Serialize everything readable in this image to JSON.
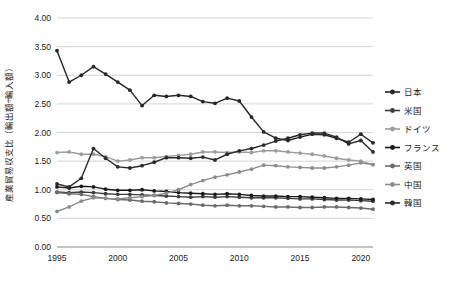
{
  "chart_data": {
    "type": "line",
    "title": "",
    "xlabel": "",
    "ylabel": "産業貿易収支比（輸出額÷輸入額）",
    "xlim": [
      1995,
      2021
    ],
    "ylim": [
      0.0,
      4.0
    ],
    "ytick_labels": [
      "4.00",
      "3.50",
      "3.00",
      "2.50",
      "2.00",
      "1.50",
      "1.00",
      "0.50",
      "0.00"
    ],
    "ytick_values": [
      4.0,
      3.5,
      3.0,
      2.5,
      2.0,
      1.5,
      1.0,
      0.5,
      0.0
    ],
    "xtick_labels": [
      "1995",
      "2000",
      "2005",
      "2010",
      "2015",
      "2020"
    ],
    "xtick_values": [
      1995,
      2000,
      2005,
      2010,
      2015,
      2020
    ],
    "grid": "horizontal",
    "legend_position": "right",
    "x": [
      1995,
      1996,
      1997,
      1998,
      1999,
      2000,
      2001,
      2002,
      2003,
      2004,
      2005,
      2006,
      2007,
      2008,
      2009,
      2010,
      2011,
      2012,
      2013,
      2014,
      2015,
      2016,
      2017,
      2018,
      2019,
      2020,
      2021
    ],
    "series": [
      {
        "name": "日本",
        "color": "#262626",
        "values": [
          3.43,
          2.88,
          3.0,
          3.15,
          3.02,
          2.88,
          2.74,
          2.47,
          2.65,
          2.63,
          2.65,
          2.63,
          2.54,
          2.51,
          2.6,
          2.55,
          2.27,
          2.01,
          1.9,
          1.86,
          1.92,
          1.97,
          1.96,
          1.9,
          1.83,
          1.97,
          1.82
        ]
      },
      {
        "name": "米国",
        "color": "#3d3d3d",
        "values": [
          0.96,
          0.95,
          0.96,
          0.95,
          0.93,
          0.92,
          0.92,
          0.91,
          0.9,
          0.89,
          0.88,
          0.87,
          0.88,
          0.87,
          0.88,
          0.87,
          0.86,
          0.86,
          0.86,
          0.85,
          0.84,
          0.84,
          0.83,
          0.82,
          0.82,
          0.81,
          0.8
        ]
      },
      {
        "name": "ドイツ",
        "color": "#9c9c9c",
        "values": [
          1.65,
          1.66,
          1.62,
          1.62,
          1.58,
          1.5,
          1.52,
          1.56,
          1.56,
          1.58,
          1.6,
          1.62,
          1.66,
          1.66,
          1.65,
          1.66,
          1.65,
          1.68,
          1.68,
          1.66,
          1.64,
          1.62,
          1.59,
          1.55,
          1.52,
          1.5,
          1.44
        ]
      },
      {
        "name": "フランス",
        "color": "#1a1a1a",
        "values": [
          1.05,
          1.03,
          1.06,
          1.05,
          1.01,
          0.99,
          0.99,
          1.0,
          0.98,
          0.97,
          0.95,
          0.94,
          0.93,
          0.92,
          0.93,
          0.92,
          0.9,
          0.89,
          0.89,
          0.88,
          0.88,
          0.87,
          0.86,
          0.85,
          0.85,
          0.84,
          0.83
        ]
      },
      {
        "name": "英国",
        "color": "#6b6b6b",
        "values": [
          0.95,
          0.93,
          0.92,
          0.88,
          0.85,
          0.83,
          0.82,
          0.8,
          0.79,
          0.77,
          0.76,
          0.75,
          0.73,
          0.72,
          0.73,
          0.72,
          0.72,
          0.71,
          0.7,
          0.7,
          0.69,
          0.69,
          0.7,
          0.7,
          0.69,
          0.68,
          0.66
        ]
      },
      {
        "name": "中国",
        "color": "#8c8c8c",
        "values": [
          0.62,
          0.7,
          0.8,
          0.86,
          0.85,
          0.84,
          0.86,
          0.88,
          0.9,
          0.94,
          1.0,
          1.09,
          1.16,
          1.22,
          1.26,
          1.31,
          1.36,
          1.43,
          1.42,
          1.4,
          1.39,
          1.38,
          1.38,
          1.4,
          1.43,
          1.47,
          1.44
        ]
      },
      {
        "name": "韓国",
        "color": "#2b2b2b",
        "values": [
          1.1,
          1.05,
          1.2,
          1.72,
          1.55,
          1.4,
          1.38,
          1.42,
          1.48,
          1.56,
          1.56,
          1.55,
          1.57,
          1.52,
          1.62,
          1.68,
          1.72,
          1.78,
          1.85,
          1.9,
          1.96,
          1.99,
          1.99,
          1.92,
          1.8,
          1.86,
          1.66
        ]
      }
    ]
  }
}
